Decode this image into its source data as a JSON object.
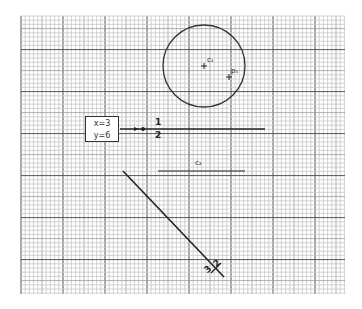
{
  "diagram": {
    "grid": {
      "left": 21,
      "top": 16,
      "right": 345,
      "bottom": 294,
      "minor_spacing": 4.2,
      "major_every": 10,
      "mid_every": 5,
      "minor_color": "#c8c8c8",
      "mid_color": "#9a9a9a",
      "major_color": "#555555"
    },
    "circle": {
      "cx": 204,
      "cy": 66,
      "r": 41,
      "stroke": "#333333"
    },
    "points": [
      {
        "name": "c1",
        "label": "c₁",
        "x": 204,
        "y": 66
      },
      {
        "name": "p1",
        "label": "p₁",
        "x": 229,
        "y": 77
      }
    ],
    "coord_box": {
      "x_label": "x=3",
      "y_label": "y=6"
    },
    "line_1": {
      "x1": 120,
      "y1": 129,
      "x2": 265,
      "y2": 129,
      "dot_x": 143,
      "label_top": "1",
      "label_bottom": "2"
    },
    "line_c2": {
      "x1": 158,
      "y1": 171,
      "x2": 245,
      "y2": 171,
      "label": "c₂"
    },
    "line_diag": {
      "x1": 123,
      "y1": 171,
      "x2": 224,
      "y2": 277,
      "label_a": "3",
      "label_b": "2"
    }
  }
}
